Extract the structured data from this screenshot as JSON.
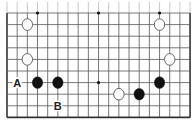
{
  "board": {
    "type": "go-board-fragment",
    "columns": 19,
    "rows_visible": 10,
    "origin_x": 7,
    "origin_y": 13,
    "spacing_x": 10.17,
    "spacing_y": 11.6,
    "edges": [
      "left",
      "right",
      "bottom"
    ],
    "line_color": "#555555",
    "edge_color": "#333333",
    "star_points": [
      {
        "col": 3,
        "row": 0
      },
      {
        "col": 9,
        "row": 0
      },
      {
        "col": 15,
        "row": 0
      },
      {
        "col": 9,
        "row": 6
      }
    ]
  },
  "stones": [
    {
      "color": "white",
      "col": 2,
      "row": 1
    },
    {
      "color": "white",
      "col": 2,
      "row": 4
    },
    {
      "color": "white",
      "col": 15,
      "row": 1
    },
    {
      "color": "white",
      "col": 16,
      "row": 4
    },
    {
      "color": "black",
      "col": 3,
      "row": 6
    },
    {
      "color": "black",
      "col": 5,
      "row": 6
    },
    {
      "color": "white",
      "col": 11,
      "row": 7
    },
    {
      "color": "black",
      "col": 13,
      "row": 7
    },
    {
      "color": "black",
      "col": 15,
      "row": 6
    }
  ],
  "labels": [
    {
      "text": "A",
      "col": 1,
      "row": 6
    },
    {
      "text": "B",
      "col": 5,
      "row": 8
    }
  ],
  "colors": {
    "black_stone": "#111111",
    "white_stone_fill": "#ffffff",
    "white_stone_stroke": "#555555"
  }
}
